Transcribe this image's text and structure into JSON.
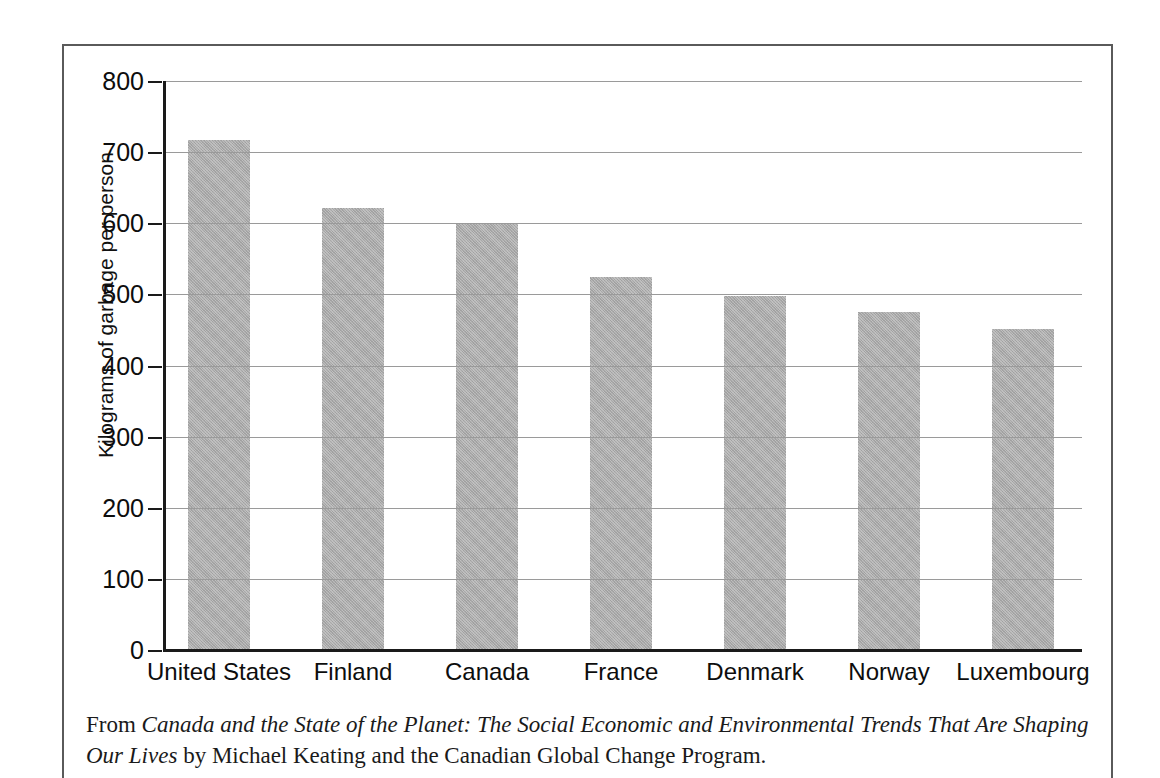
{
  "chart_data": {
    "type": "bar",
    "title": "",
    "xlabel": "",
    "ylabel": "Kilograms of garbage per person",
    "categories": [
      "United States",
      "Finland",
      "Canada",
      "France",
      "Denmark",
      "Norway",
      "Luxembourg"
    ],
    "values": [
      717,
      621,
      600,
      524,
      498,
      475,
      451
    ],
    "ylim": [
      0,
      800
    ],
    "ytick_labels": [
      "800",
      "700",
      "600",
      "500",
      "400",
      "300",
      "200",
      "100",
      "0"
    ],
    "ytick_values": [
      800,
      700,
      600,
      500,
      400,
      300,
      200,
      100,
      0
    ],
    "grid": true,
    "legend": "none",
    "bar_color": "#a9a9a9",
    "gridline_color": "#9a9a9a",
    "axis_color": "#1a1a1a"
  },
  "caption": {
    "lead": "From ",
    "book_title": "Canada and the State of the Planet: The Social Economic and Environmental Trends That Are Shaping Our Lives",
    "trail": " by Michael Keating and the Canadian Global Change Program."
  },
  "frame": {
    "border_color": "#5a5a5a"
  }
}
